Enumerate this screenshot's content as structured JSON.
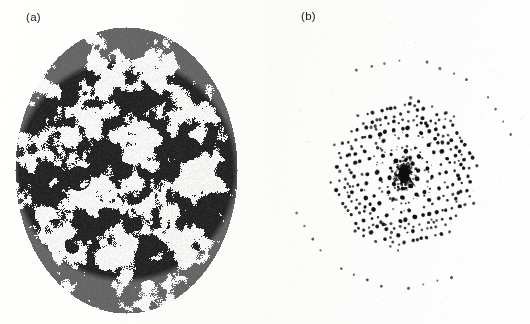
{
  "figure": {
    "type": "scientific-figure-two-panel",
    "width": 530,
    "height": 324,
    "background_color": "#fefefe",
    "ink_color": "#141414",
    "panels": [
      {
        "id": "a",
        "label": "(a)",
        "label_x": 26,
        "label_y": 11,
        "description": "quasicrystal structure micrograph, labyrinthine binary speckle texture inside an elliptical aperture",
        "render": "speckle-ellipse",
        "ellipse": {
          "cx": 126,
          "cy": 170,
          "rx": 111,
          "ry": 143
        },
        "texture": {
          "cell_size": 3.0,
          "blob_scale": 0.105,
          "threshold": 0.0,
          "fivefold_orders": 5,
          "edge_darkening": 0.22
        }
      },
      {
        "id": "b",
        "label": "(b)",
        "label_x": 301,
        "label_y": 10,
        "description": "optical diffraction pattern (Fourier transform) of panel a: quasi-periodic array of sharp dark Bragg spots with a saturated dark core and a faint halo ring",
        "render": "diffraction-spots",
        "center": {
          "cx": 404,
          "cy": 174
        },
        "field": {
          "x0": 272,
          "y0": 22,
          "x1": 528,
          "y1": 318
        },
        "spots": {
          "generator": "fivefold-quasilattice",
          "base_spacing": 23.5,
          "symmetry_fold": 5,
          "orders": 4,
          "max_radius": 168,
          "size_min_px": 1.0,
          "size_max_px": 4.6,
          "jitter_px": 1.6,
          "count_approx": 300
        },
        "core": {
          "radius_px": 9,
          "starburst_arms": 6,
          "halo_ring_radius_px": 26,
          "halo_ring_dots": 34
        }
      }
    ]
  },
  "chart_data": {
    "type": "scatter",
    "title": "",
    "subtitle": "",
    "xlabel": "",
    "ylabel": "",
    "grid": false,
    "legend_position": "none",
    "annotations": [
      "(a)",
      "(b)"
    ],
    "panels": [
      {
        "name": "(a) real-space structure",
        "kind": "image",
        "colors": [
          "#ffffff",
          "#141414"
        ],
        "note": "binary black/white mottled quasicrystalline texture within an ellipse"
      },
      {
        "name": "(b) diffraction pattern",
        "kind": "scatter",
        "x": [],
        "y": [],
        "note": "sharp diffraction maxima on a five-fold quasi-periodic reciprocal lattice; intensity encoded as spot area; central beam saturated"
      }
    ]
  }
}
